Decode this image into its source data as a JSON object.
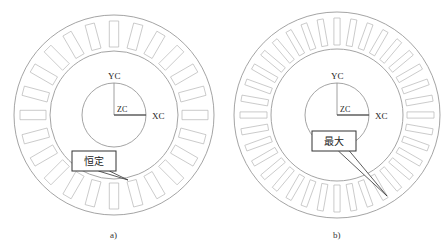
{
  "figures": [
    {
      "id": "a",
      "caption": "a)",
      "center": [
        114,
        115
      ],
      "outer_radius": 100,
      "ring_radius": 64,
      "inner_radius": 32,
      "slot_count": 24,
      "slot_width_deg": 8,
      "axes": {
        "y": "YC",
        "x": "XC",
        "z": "ZC"
      },
      "callout": {
        "text": "恒定",
        "box": [
          72,
          151,
          44,
          20
        ],
        "tip": [
          128,
          180
        ]
      }
    },
    {
      "id": "b",
      "caption": "b)",
      "center": [
        337,
        115
      ],
      "outer_radius": 103,
      "ring_radius": 66,
      "inner_radius": 32,
      "slot_count": 36,
      "slot_width_deg": 5,
      "axes": {
        "y": "YC",
        "x": "XC",
        "z": "ZC"
      },
      "callout": {
        "text": "最大",
        "box": [
          312,
          131,
          44,
          20
        ],
        "tip": [
          387,
          196
        ]
      }
    }
  ],
  "colors": {
    "outline": "#9a9a9a",
    "axis": "#444444",
    "background": "#ffffff"
  }
}
